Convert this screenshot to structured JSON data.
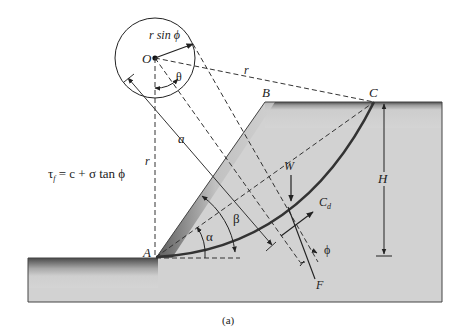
{
  "figure": {
    "caption": "(a)",
    "equation": "τf = c + σ tan ϕ",
    "equation_parts": {
      "tau": "τ",
      "sub": "f",
      "rest": " = c + σ tan ϕ"
    },
    "labels": {
      "O": "O",
      "A": "A",
      "B": "B",
      "C": "C",
      "r_sin_phi": "r sin ϕ",
      "theta": "θ",
      "r_top": "r",
      "r_left": "r",
      "a": "a",
      "alpha": "α",
      "beta": "β",
      "W": "W",
      "Cd": "C",
      "Cd_sub": "d",
      "phi": "ϕ",
      "F": "F",
      "H": "H"
    },
    "colors": {
      "soil_fill": "#cfcfcf",
      "soil_dark": "#5a5a5a",
      "line": "#222222",
      "slip_surface": "#333333"
    }
  }
}
